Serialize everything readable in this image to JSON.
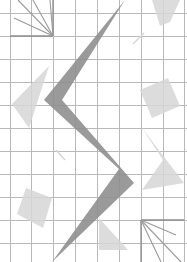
{
  "canvas": {
    "width": 187,
    "height": 262,
    "background": "#ffffff"
  },
  "colors": {
    "grid": "#b9b9b9",
    "grid_strong": "#8c8c8c",
    "main_shape": "#8f8f8f",
    "light_shape": "#d6d6d6",
    "fan_line": "#9a9a9a"
  },
  "grid": {
    "x_lines": [
      10,
      31,
      53,
      75,
      97,
      119,
      141,
      163,
      184
    ],
    "y_lines": [
      13,
      36,
      59,
      82,
      105,
      128,
      151,
      174,
      197,
      220,
      243
    ],
    "strong_segments": [
      {
        "x1": 10,
        "y1": 36,
        "x2": 53,
        "y2": 36
      },
      {
        "x1": 53,
        "y1": 0,
        "x2": 53,
        "y2": 36
      },
      {
        "x1": 141,
        "y1": 220,
        "x2": 184,
        "y2": 220
      },
      {
        "x1": 141,
        "y1": 220,
        "x2": 141,
        "y2": 262
      }
    ]
  },
  "shapes": {
    "zigzag": "125,0 62,100 134,183 52,262 119,169 44,100",
    "light_polygons": [
      {
        "name": "left-upper-triangle",
        "points": "49,66 12,104 29,128"
      },
      {
        "name": "right-square",
        "points": "140,90 168,78 180,106 152,118"
      },
      {
        "name": "right-chevron",
        "points": "142,128 184,183 142,190 163,160"
      },
      {
        "name": "left-square",
        "points": "17,214 26,188 52,198 43,228"
      },
      {
        "name": "bottom-triangle",
        "points": "99,218 128,250 99,250"
      },
      {
        "name": "top-right-wedge",
        "points": "152,0 180,0 170,22 160,26"
      }
    ],
    "fan_top_left": {
      "origin": [
        53,
        36
      ],
      "ends": [
        [
          18,
          0
        ],
        [
          33,
          0
        ],
        [
          50,
          0
        ],
        [
          14,
          18
        ]
      ]
    },
    "fan_bottom_right": {
      "origin": [
        141,
        220
      ],
      "ends": [
        [
          176,
          235
        ],
        [
          181,
          262
        ],
        [
          161,
          262
        ]
      ]
    },
    "dashes": [
      {
        "x1": 144,
        "y1": 33,
        "x2": 133,
        "y2": 44
      },
      {
        "x1": 56,
        "y1": 150,
        "x2": 65,
        "y2": 160
      }
    ]
  }
}
